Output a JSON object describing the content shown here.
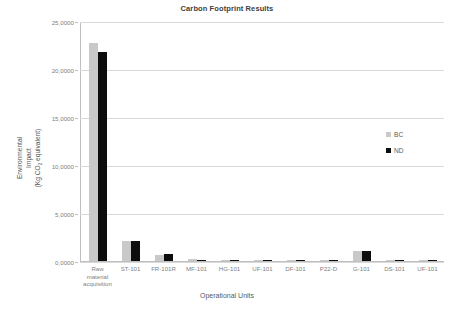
{
  "chart_data": {
    "type": "bar",
    "title": "Carbon Footprint Results",
    "xlabel": "Operational Units",
    "ylabel_lines": [
      "Environmental",
      "Impact",
      "(Kg CO2 equivalent)"
    ],
    "ylabel": "Environmental Impact (Kg CO2 equivalent)",
    "categories": [
      "Raw material acquisition",
      "ST-101",
      "FR-101R",
      "MF-101",
      "HG-101",
      "UF-101",
      "DF-101",
      "P22-D",
      "G-101",
      "DS-101",
      "UF-101"
    ],
    "series": [
      {
        "name": "BC",
        "color": "#c9c9c9",
        "values": [
          22.7,
          2.05,
          0.6,
          0.18,
          0.15,
          0.1,
          0.1,
          0.05,
          1.0,
          0.15,
          0.05
        ]
      },
      {
        "name": "ND",
        "color": "#0d0d0d",
        "values": [
          21.8,
          2.1,
          0.75,
          0.12,
          0.1,
          0.08,
          0.08,
          0.04,
          1.05,
          0.1,
          0.04
        ]
      }
    ],
    "ylim": [
      0,
      25
    ],
    "ytick_values": [
      0,
      5,
      10,
      15,
      20,
      25
    ],
    "ytick_labels": [
      "0,0000",
      "5,0000",
      "10,0000",
      "15,0000",
      "20,0000",
      "25,0000"
    ],
    "grid": true,
    "legend_position": "right"
  },
  "legend": {
    "items": [
      {
        "label": "BC",
        "color": "#c9c9c9"
      },
      {
        "label": "ND",
        "color": "#0d0d0d"
      }
    ]
  }
}
